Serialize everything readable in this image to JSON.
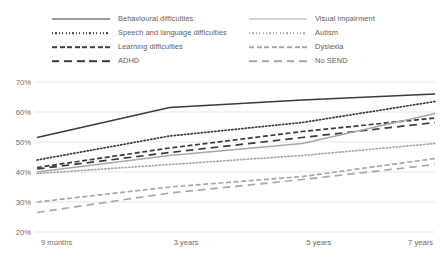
{
  "chart_data": {
    "type": "line",
    "title": "",
    "xlabel": "",
    "ylabel": "",
    "x": [
      "9 months",
      "3 years",
      "5 years",
      "7 years"
    ],
    "categories": [
      "9 months",
      "3 years",
      "5 years",
      "7 years"
    ],
    "ylim": [
      20,
      70
    ],
    "yticks": [
      20,
      30,
      40,
      50,
      60,
      70
    ],
    "ytick_labels": [
      "20%",
      "30%",
      "40%",
      "50%",
      "60%",
      "70%"
    ],
    "grid": true,
    "legend_position": "top",
    "value_unit": "%",
    "series": [
      {
        "name": "Behavioural difficulties",
        "values": [
          51.5,
          61.5,
          64.0,
          66.0
        ],
        "style": "solid",
        "color": "#3b3b3b"
      },
      {
        "name": "Speech and language difficulties",
        "values": [
          44.0,
          52.0,
          56.5,
          63.5
        ],
        "style": "dotted",
        "color": "#3b3b3b"
      },
      {
        "name": "Learning difficulties",
        "values": [
          41.5,
          48.0,
          53.5,
          58.0
        ],
        "style": "dashed",
        "color": "#3b3b3b"
      },
      {
        "name": "ADHD",
        "values": [
          41.0,
          46.5,
          51.5,
          56.5
        ],
        "style": "long-dash",
        "color": "#3b3b3b"
      },
      {
        "name": "Visual impairment",
        "values": [
          40.0,
          45.5,
          49.5,
          59.5
        ],
        "style": "solid",
        "color": "#a8a8a8"
      },
      {
        "name": "Autism",
        "values": [
          39.5,
          42.5,
          45.5,
          49.5
        ],
        "style": "dotted",
        "color": "#a8a8a8"
      },
      {
        "name": "Dyslexia",
        "values": [
          30.0,
          35.0,
          38.5,
          44.5
        ],
        "style": "dashed",
        "color": "#a8a8a8"
      },
      {
        "name": "No SEND",
        "values": [
          26.5,
          33.0,
          37.5,
          42.5
        ],
        "style": "long-dash",
        "color": "#a8a8a8"
      }
    ]
  },
  "legend": {
    "columns": [
      {
        "items": [
          {
            "label": "Behavioural difficulties",
            "series_index": 0
          },
          {
            "label": "Speech and language difficulties",
            "series_index": 1
          },
          {
            "label": "Learning difficulties",
            "series_index": 2
          },
          {
            "label": "ADHD",
            "series_index": 3
          }
        ]
      },
      {
        "items": [
          {
            "label": "Visual impairment",
            "series_index": 4
          },
          {
            "label": "Autism",
            "series_index": 5
          },
          {
            "label": "Dyslexia",
            "series_index": 6
          },
          {
            "label": "No SEND",
            "series_index": 7
          }
        ]
      }
    ]
  },
  "axes": {
    "y_labels": [
      "70%",
      "60%",
      "50%",
      "40%",
      "30%",
      "20%"
    ],
    "x_labels": [
      "9 months",
      "3 years",
      "5 years",
      "7 years"
    ]
  },
  "colors": {
    "dark_line": "#3b3b3b",
    "light_line": "#a8a8a8",
    "grid": "#e6e6e6",
    "text": "#6b6b6b",
    "background": "#ffffff"
  }
}
